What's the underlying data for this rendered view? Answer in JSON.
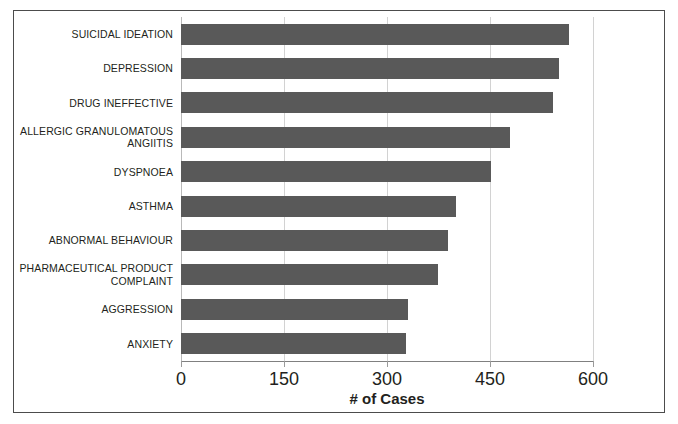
{
  "chart_data": {
    "type": "bar",
    "orientation": "horizontal",
    "title": "",
    "xlabel": "# of Cases",
    "ylabel": "",
    "categories": [
      "SUICIDAL IDEATION",
      "DEPRESSION",
      "DRUG INEFFECTIVE",
      "ALLERGIC GRANULOMATOUS ANGIITIS",
      "DYSPNOEA",
      "ASTHMA",
      "ABNORMAL BEHAVIOUR",
      "PHARMACEUTICAL PRODUCT COMPLAINT",
      "AGGRESSION",
      "ANXIETY"
    ],
    "values": [
      565,
      550,
      542,
      479,
      452,
      400,
      389,
      374,
      330,
      328
    ],
    "xlim": [
      0,
      600
    ],
    "xticks": [
      0,
      150,
      300,
      450,
      600
    ],
    "xtick_labels": [
      "0",
      "150",
      "300",
      "450",
      "600"
    ],
    "grid": true,
    "grid_axis": "x",
    "legend": false,
    "bar_color": "#595959",
    "background_color": "#ffffff",
    "border_color": "#4c4c4c",
    "gridline_color": "#d2d2d2"
  }
}
